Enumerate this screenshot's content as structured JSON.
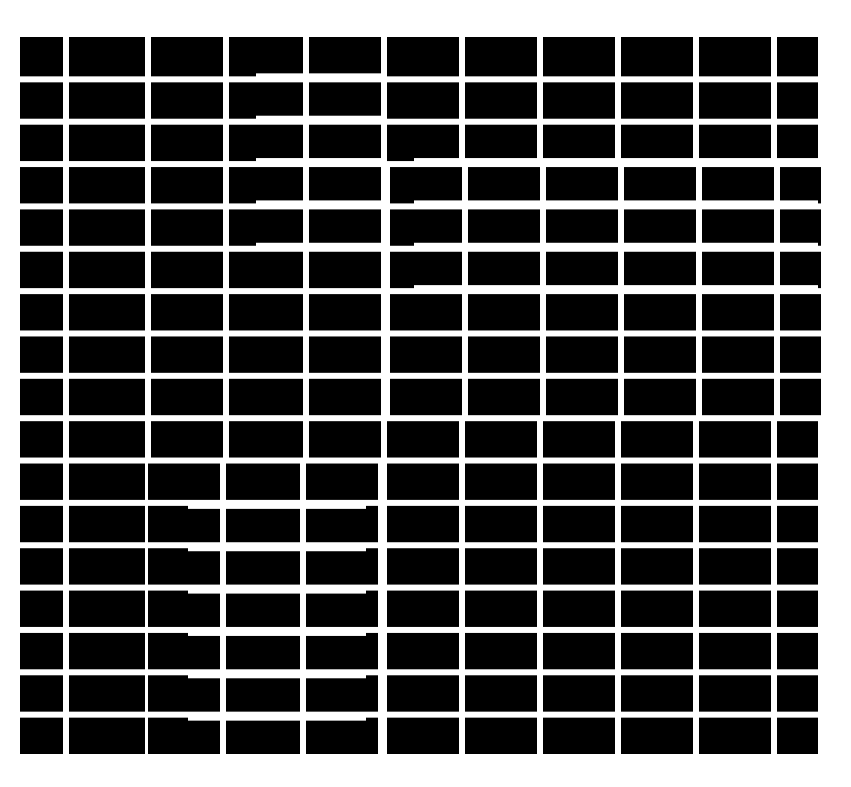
{
  "figure": {
    "title": "",
    "colors": {
      "background": "#ffffff",
      "tile": "#000000",
      "mortar": "#ffffff"
    },
    "grid": {
      "left": 20,
      "top": 37,
      "right": 818,
      "bottom": 757,
      "rows": 17,
      "col_edges": [
        20,
        66,
        148,
        226,
        306,
        384,
        462,
        540,
        618,
        696,
        774,
        818
      ],
      "gap": 6
    },
    "row_shift_regions": [
      {
        "rows": [
          1,
          5
        ],
        "x_from": 256,
        "x_to": 384,
        "dy": -3
      },
      {
        "rows": [
          3,
          6
        ],
        "x_from": 414,
        "x_to": 818,
        "dy": -3
      },
      {
        "rows": [
          11,
          17
        ],
        "x_from": 188,
        "x_to": 366,
        "dy": 3
      }
    ]
  }
}
